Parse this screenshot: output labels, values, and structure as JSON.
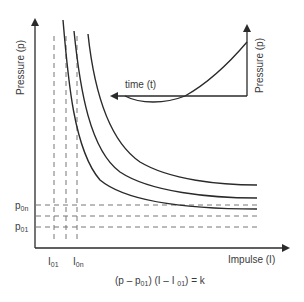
{
  "main_plot": {
    "y_axis_label": "Pressure (p)",
    "x_axis_label": "Impulse (I)",
    "p_labels": {
      "p0n": {
        "base": "p",
        "sub": "0n"
      },
      "p01": {
        "base": "p",
        "sub": "01"
      }
    },
    "i_labels": {
      "i01": {
        "base": "I",
        "sub": "01"
      },
      "i0n": {
        "base": "I",
        "sub": "0n"
      }
    },
    "curve_count": 3
  },
  "inset": {
    "time_label": "time (t)",
    "pressure_label": "Pressure (p)"
  },
  "equation": {
    "part1": "(p – p",
    "sub1": "01",
    "part2": ") (I – I ",
    "sub2": "01",
    "part3": ") = k"
  },
  "colors": {
    "line": "#2a2a2a",
    "dashed": "#777777",
    "text": "#3a3a3a"
  }
}
